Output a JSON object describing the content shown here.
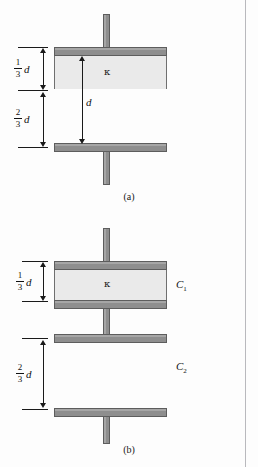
{
  "figure": {
    "panels": [
      {
        "id": "a",
        "caption": "(a)",
        "dielectric_symbol": "κ",
        "gap_label": "d",
        "dimensions": [
          {
            "numerator": "1",
            "denominator": "3",
            "symbol": "d"
          },
          {
            "numerator": "2",
            "denominator": "3",
            "symbol": "d"
          }
        ],
        "capacitor_labels": []
      },
      {
        "id": "b",
        "caption": "(b)",
        "dielectric_symbol": "κ",
        "gap_label": "",
        "dimensions": [
          {
            "numerator": "1",
            "denominator": "3",
            "symbol": "d"
          },
          {
            "numerator": "2",
            "denominator": "3",
            "symbol": "d"
          }
        ],
        "capacitor_labels": [
          {
            "base": "C",
            "sub": "1"
          },
          {
            "base": "C",
            "sub": "2"
          }
        ]
      }
    ],
    "colors": {
      "plate_fill": "#8e8e8e",
      "plate_edge": "#5d5d5d",
      "dielectric_fill": "#eaeaea",
      "background": "#fdfdfd",
      "ink": "#1a1a1a",
      "border_rule": "#b9b9bd"
    }
  }
}
